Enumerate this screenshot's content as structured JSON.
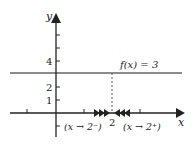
{
  "diagram": {
    "axes": {
      "x_label": "x",
      "y_label": "y"
    },
    "y_ticks": [
      {
        "label": "4"
      },
      {
        "label": "2"
      },
      {
        "label": "1"
      }
    ],
    "x_ticks": [
      {
        "label": "2"
      }
    ],
    "function_label": "f(x) = 3",
    "left_approach_label": "(x → 2⁻)",
    "right_approach_label": "(x → 2⁺)",
    "colors": {
      "line": "#333333",
      "axis": "#222222",
      "dashed": "#555555"
    }
  }
}
